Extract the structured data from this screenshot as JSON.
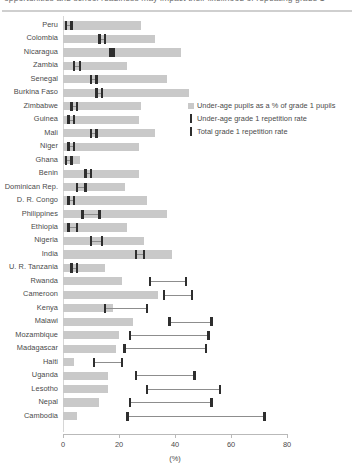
{
  "figure": {
    "clipped_title": "opportunities and school readiness may impact their likelihood of repeating grade 1",
    "axis_title": "(%)"
  },
  "legend": {
    "position": "right-upper",
    "items": [
      {
        "label": "Under-age pupils as a % of grade 1 pupils",
        "marker": "bar-swatch",
        "color": "#c9c9c9"
      },
      {
        "label": "Under-age grade 1 repetition rate",
        "marker": "tick-swatch",
        "color": "#2e2e2e"
      },
      {
        "label": "Total grade 1 repetition rate",
        "marker": "tick-swatch",
        "color": "#2e2e2e"
      }
    ]
  },
  "chart_data": {
    "type": "bar",
    "title": "",
    "xlabel": "(%)",
    "ylabel": "",
    "xlim": [
      0,
      80
    ],
    "xticks": [
      0,
      20,
      40,
      60,
      80
    ],
    "grid": false,
    "categories": [
      "Peru",
      "Colombia",
      "Nicaragua",
      "Zambia",
      "Senegal",
      "Burkina Faso",
      "Zimbabwe",
      "Guinea",
      "Mali",
      "Niger",
      "Ghana",
      "Benin",
      "Dominican Rep.",
      "D. R. Congo",
      "Philippines",
      "Ethiopia",
      "Nigeria",
      "India",
      "U. R. Tanzania",
      "Rwanda",
      "Cameroon",
      "Kenya",
      "Malawi",
      "Mozambique",
      "Madagascar",
      "Haiti",
      "Uganda",
      "Lesotho",
      "Nepal",
      "Cambodia"
    ],
    "series": [
      {
        "name": "Under-age pupils as a % of grade 1 pupils",
        "color": "#c9c9c9",
        "values": [
          28,
          33,
          42,
          23,
          37,
          45,
          28,
          27,
          33,
          27,
          6,
          27,
          22,
          30,
          37,
          23,
          29,
          39,
          15,
          21,
          34,
          18,
          25,
          20,
          19,
          4,
          16,
          16,
          13,
          5
        ]
      },
      {
        "name": "Under-age grade 1 repetition rate",
        "color": "#2e2e2e",
        "values": [
          1,
          13,
          17,
          4,
          10,
          12,
          3,
          2,
          10,
          2,
          1,
          8,
          5,
          2,
          7,
          2,
          10,
          26,
          3,
          31,
          36,
          15,
          38,
          24,
          22,
          11,
          26,
          30,
          24,
          23
        ]
      },
      {
        "name": "Total grade 1 repetition rate",
        "color": "#2e2e2e",
        "values": [
          3,
          15,
          18,
          6,
          12,
          14,
          5,
          4,
          12,
          4,
          3,
          10,
          8,
          4,
          13,
          5,
          14,
          29,
          5,
          44,
          46,
          30,
          53,
          52,
          51,
          21,
          47,
          56,
          53,
          72
        ]
      }
    ]
  }
}
